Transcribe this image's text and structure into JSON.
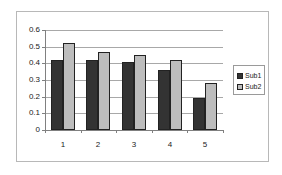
{
  "chart_data": {
    "type": "bar",
    "title": "",
    "xlabel": "",
    "ylabel": "",
    "categories": [
      "1",
      "2",
      "3",
      "4",
      "5"
    ],
    "series": [
      {
        "name": "Sub1",
        "color": "#333333",
        "values": [
          0.42,
          0.42,
          0.41,
          0.36,
          0.19
        ]
      },
      {
        "name": "Sub2",
        "color": "#bdbdbd",
        "values": [
          0.52,
          0.47,
          0.45,
          0.42,
          0.28
        ]
      }
    ],
    "ylim": [
      0,
      0.6
    ],
    "yticks": [
      "0",
      "0.1",
      "0.2",
      "0.3",
      "0.4",
      "0.5",
      "0.6"
    ],
    "grid": true,
    "legend_position": "right"
  },
  "legend": {
    "items": [
      {
        "label": "Sub1"
      },
      {
        "label": "Sub2"
      }
    ]
  }
}
